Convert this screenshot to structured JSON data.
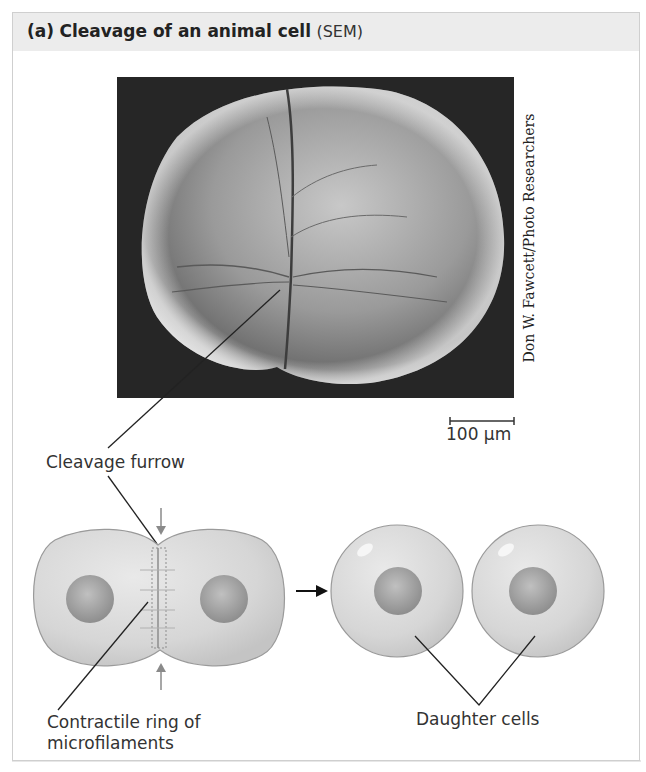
{
  "figure": {
    "panel_letter": "(a)",
    "title_bold": "Cleavage of an animal cell",
    "title_suffix": "(SEM)",
    "photo_description": "Scanning electron micrograph of a dividing animal cell showing a cleavage furrow",
    "photo_credit": "Don W. Fawcett/Photo Researchers",
    "scale_bar_label": "100 µm"
  },
  "labels": {
    "cleavage_furrow": "Cleavage furrow",
    "contractile_ring_line1": "Contractile ring of",
    "contractile_ring_line2": "microfilaments",
    "daughter_cells": "Daughter cells"
  },
  "colors": {
    "header_bg": "#ececec",
    "border": "#cfcfcf",
    "photo_bg": "#262626",
    "cell_fill": "#d9d9d9",
    "nucleus_fill": "#a8a8a8",
    "arrow_gray": "#8a8a8a"
  }
}
